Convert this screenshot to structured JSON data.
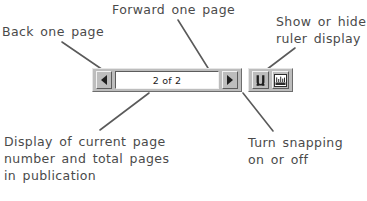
{
  "callouts": {
    "back": {
      "lines": [
        "Back  one  page"
      ]
    },
    "forward": {
      "lines": [
        "Forward  one  page"
      ]
    },
    "ruler": {
      "lines": [
        "Show  or  hide",
        "ruler  display"
      ]
    },
    "page_display": {
      "lines": [
        "Display  of  current  page",
        "number  and  total  pages",
        "in  publication"
      ]
    },
    "snapping": {
      "lines": [
        "Turn  snapping",
        "on  or  off"
      ]
    }
  },
  "toolbar": {
    "back_button": {
      "icon": "triangle-left-icon",
      "label": "Back one page"
    },
    "forward_button": {
      "icon": "triangle-right-icon",
      "label": "Forward one page"
    },
    "page_field": {
      "value": "2 of 2",
      "current_page": 2,
      "total_pages": 2
    },
    "snap_button": {
      "icon": "magnet-icon",
      "label": "Turn snapping on or off"
    },
    "ruler_button": {
      "icon": "ruler-icon",
      "label": "Show or hide ruler display"
    }
  },
  "colors": {
    "toolbar_face": "#bdbdbd",
    "field_background": "#ffffff",
    "text": "#4a4a4a",
    "leader_line": "#5a5a5a",
    "arrow": "#1f1f1f"
  }
}
